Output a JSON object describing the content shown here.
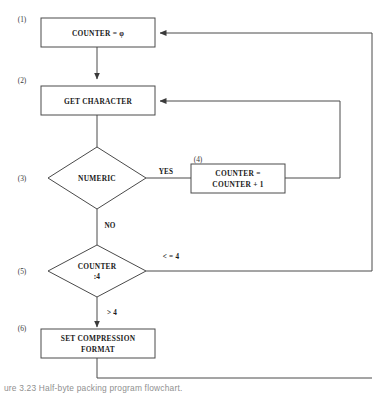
{
  "figure": {
    "caption_partial": "ure 3.23   Half-byte packing program flowchart."
  },
  "nodes": [
    {
      "step": "(1)",
      "shape": "process",
      "lines": [
        "COUNTER = φ"
      ]
    },
    {
      "step": "(2)",
      "shape": "process",
      "lines": [
        "GET CHARACTER"
      ]
    },
    {
      "step": "(3)",
      "shape": "decision",
      "lines": [
        "NUMERIC"
      ]
    },
    {
      "step": "(4)",
      "shape": "process",
      "lines": [
        "COUNTER =",
        "COUNTER + 1"
      ]
    },
    {
      "step": "(5)",
      "shape": "decision",
      "lines": [
        "COUNTER",
        ":4"
      ]
    },
    {
      "step": "(6)",
      "shape": "process",
      "lines": [
        "SET COMPRESSION",
        "FORMAT"
      ]
    }
  ],
  "branch_labels": {
    "numeric_yes": "YES",
    "numeric_no": "NO",
    "counter_le4": "< = 4",
    "counter_gt4": "> 4"
  },
  "colors": {
    "stroke": "#4a4a4a",
    "text": "#1a1a1a",
    "background": "#ffffff"
  }
}
